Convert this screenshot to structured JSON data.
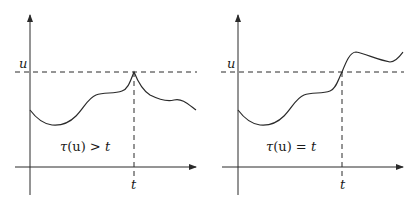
{
  "panels": [
    {
      "id": "left",
      "level_label": "u",
      "time_label": "t",
      "annotation_tau": "τ",
      "annotation_arg": "(u)",
      "annotation_rel": " > ",
      "annotation_rhs": "t",
      "annotation_full": "τ(u) > t",
      "description": "Process touches level u exactly at time t (peak) without crossing"
    },
    {
      "id": "right",
      "level_label": "u",
      "time_label": "t",
      "annotation_tau": "τ",
      "annotation_arg": "(u)",
      "annotation_rel": " = ",
      "annotation_rhs": "t",
      "annotation_full": "τ(u) = t",
      "description": "Process crosses level u at time t"
    }
  ],
  "colors": {
    "ink": "#2a2a2a",
    "background": "#ffffff"
  }
}
